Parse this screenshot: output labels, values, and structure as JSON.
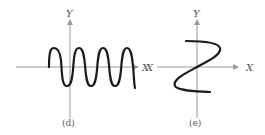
{
  "figures": [
    {
      "id": "d",
      "caption": "(d)",
      "y_label": "Y",
      "x_label": "X",
      "description": "Sinusoidal wave oscillating about the X axis, four periods"
    },
    {
      "id": "e",
      "caption": "(e)",
      "y_label": "Y",
      "x_label_right": "X",
      "x_label_left": "X",
      "description": "S-shaped (Z-like) curve passing through the origin"
    }
  ],
  "colors": {
    "axis": "#9a9a9a",
    "curve": "#1a1a1a",
    "label": "#555555"
  }
}
